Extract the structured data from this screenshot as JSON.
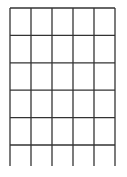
{
  "diagram": {
    "type": "grid",
    "columns": 5,
    "rows_closed": 5,
    "open_bottom_row": true,
    "line_color": "#333333",
    "background": "#ffffff"
  }
}
